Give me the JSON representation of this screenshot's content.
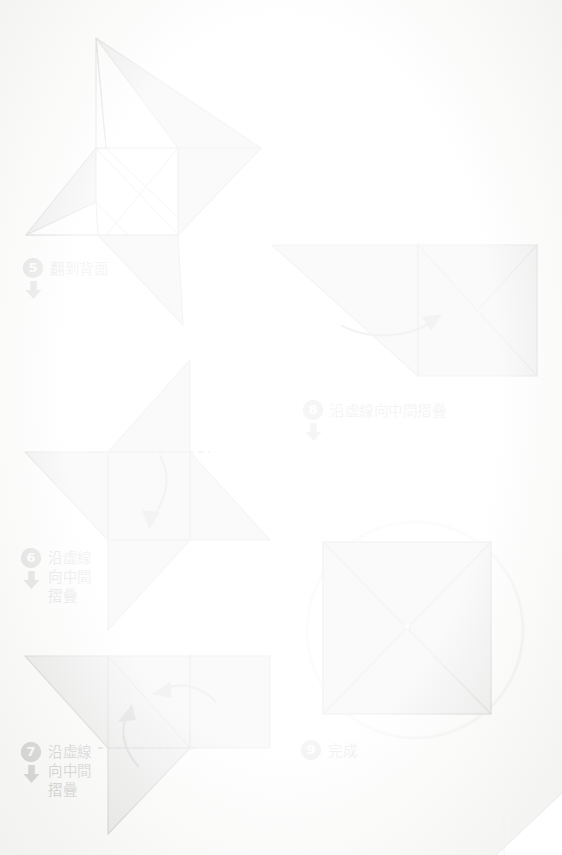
{
  "page": {
    "background_color": "#fbfbfa",
    "paper_fill_color": "#9a9a9a",
    "paper_fill_color_light": "#ffffff",
    "line_color": "#2f2f2f",
    "badge_color": "#4a4a4a",
    "badge_text_color": "#ffffff",
    "circle_outline_color": "#bdbdbd"
  },
  "steps": [
    {
      "number": "5",
      "text": "翻到背面",
      "lines": [
        "翻到背面"
      ],
      "multiline": false,
      "figure": "four-point-star-pinwheel",
      "arrow": "down-thick"
    },
    {
      "number": "6",
      "text": "沿虛線\n向中間\n摺疊",
      "lines": [
        "沿虛線",
        "向中間",
        "摺疊"
      ],
      "multiline": true,
      "figure": "pinwheel-with-top-dashed-fold",
      "arrow": "down-thick"
    },
    {
      "number": "7",
      "text": "沿虛線\n向中間\n摺疊",
      "lines": [
        "沿虛線",
        "向中間",
        "摺疊"
      ],
      "multiline": true,
      "figure": "parallelogram-with-two-dashed-folds",
      "arrow": "down-thick"
    },
    {
      "number": "8",
      "text": "沿虛線向中間摺疊",
      "lines": [
        "沿虛線向中間摺疊"
      ],
      "multiline": false,
      "figure": "triangle-square-with-vertical-dashed-fold",
      "arrow": "down-thick"
    },
    {
      "number": "9",
      "text": "完成",
      "lines": [
        "完成"
      ],
      "multiline": false,
      "figure": "finished-square-in-circle",
      "arrow": "none"
    }
  ],
  "legend": {
    "dashed_line_meaning": "fold line",
    "curved_arrow_meaning": "fold direction"
  }
}
